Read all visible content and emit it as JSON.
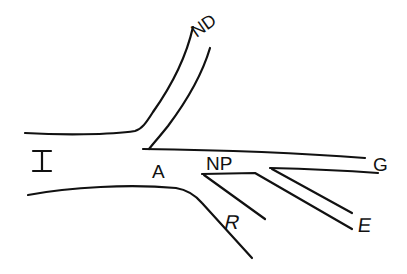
{
  "diagram": {
    "type": "branching-channel-line-drawing",
    "stroke_color": "#111111",
    "background_color": "#ffffff",
    "labels": {
      "I": "I",
      "A": "A",
      "ND": "ND",
      "NP": "NP",
      "G": "G",
      "E": "E",
      "R": "R"
    },
    "branches": [
      {
        "id": "main",
        "label": "I",
        "direction": "left"
      },
      {
        "id": "upper",
        "label": "ND",
        "direction": "up-right"
      },
      {
        "id": "right-upper",
        "label": "G",
        "direction": "right"
      },
      {
        "id": "right-lower",
        "label": "E",
        "direction": "down-right"
      },
      {
        "id": "lower",
        "label": "R",
        "direction": "down-right"
      },
      {
        "id": "junction",
        "label": "A"
      },
      {
        "id": "sub-junction",
        "label": "NP"
      }
    ]
  }
}
